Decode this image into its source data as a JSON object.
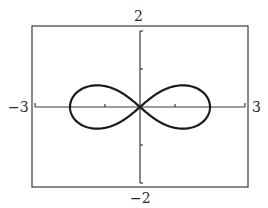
{
  "chart_data": {
    "type": "line",
    "title": "",
    "equation_hint": "r^2 = 4 cos(2θ)",
    "xlabel": "",
    "ylabel": "",
    "xlim": [
      -3,
      3
    ],
    "ylim": [
      -2,
      2
    ],
    "xtick_marks": [
      -3,
      -2,
      -1,
      0,
      1,
      2,
      3
    ],
    "ytick_marks": [
      -2,
      -1,
      0,
      1,
      2
    ],
    "labels": {
      "xmin": "−3",
      "xmax": "3",
      "ymin": "−2",
      "ymax": "2"
    },
    "grid": false,
    "legend": null,
    "series": [
      {
        "name": "lemniscate",
        "a": 2,
        "y_extent": 0.57,
        "x_extent": 2,
        "color": "#1a1a1a"
      }
    ],
    "key_points": [
      {
        "x": -2,
        "y": 0
      },
      {
        "x": 0,
        "y": 0
      },
      {
        "x": 2,
        "y": 0
      },
      {
        "x": -1.1,
        "y": 0.57
      },
      {
        "x": 1.1,
        "y": 0.57
      },
      {
        "x": -1.1,
        "y": -0.57
      },
      {
        "x": 1.1,
        "y": -0.57
      }
    ]
  },
  "colors": {
    "frame": "#3a3a3a",
    "axis": "#3a3a3a",
    "curve": "#1a1a1a",
    "background": "#ffffff"
  }
}
